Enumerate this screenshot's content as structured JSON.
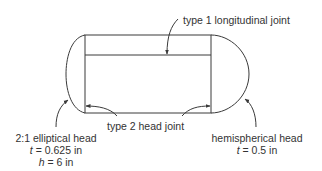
{
  "diagram": {
    "title": "",
    "colors": {
      "stroke": "#3a3a3a",
      "text": "#333333",
      "background": "#ffffff"
    },
    "labels": {
      "longitudinal_joint": "type 1 longitudinal joint",
      "head_joint": "type 2 head joint",
      "elliptical_head": {
        "name": "2:1 elliptical head",
        "t_var": "t",
        "t_value": " = 0.625 in",
        "h_var": "h",
        "h_value": " = 6 in"
      },
      "hemispherical_head": {
        "name": "hemispherical head",
        "t_var": "t",
        "t_value": " = 0.5 in"
      }
    },
    "components": [
      "cylindrical shell",
      "2:1 elliptical head (left)",
      "hemispherical head (right)",
      "type 1 longitudinal joint",
      "type 2 head joint (two circumferential seams)"
    ]
  }
}
